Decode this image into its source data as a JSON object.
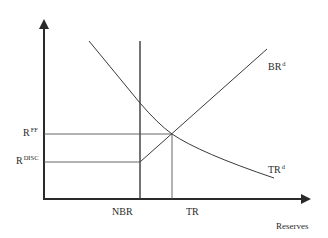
{
  "diagram": {
    "type": "reserves-market-supply-demand",
    "axes": {
      "x_label": "Reserves",
      "y_label": ""
    },
    "y_levels": [
      {
        "id": "rff",
        "base": "R",
        "sup": "FF"
      },
      {
        "id": "rdisc",
        "base": "R",
        "sup": "DISC"
      }
    ],
    "x_levels": [
      {
        "id": "nbr",
        "label": "NBR"
      },
      {
        "id": "tr",
        "label": "TR"
      }
    ],
    "curves": [
      {
        "id": "brd",
        "base": "BR",
        "sup": "d",
        "description": "Borrowed reserves: flat at R^DISC up to NBR, then rising"
      },
      {
        "id": "trd",
        "base": "TR",
        "sup": "d",
        "description": "Total reserves demand: downward sloping, convex"
      }
    ],
    "colors": {
      "axis": "#2a2a2a",
      "line": "#3a3a3a",
      "guide": "#555555"
    }
  }
}
